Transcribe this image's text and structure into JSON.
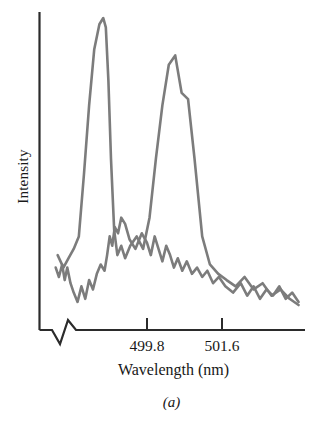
{
  "figure": {
    "subcaption": "(a)",
    "axis_color": "#2b2b2b",
    "trace_color": "#7c7c7c",
    "background": "#ffffff"
  },
  "chart_data": {
    "type": "line",
    "title": "",
    "subtitle": "",
    "xlabel": "Wavelength (nm)",
    "ylabel": "Intensity",
    "grid": false,
    "legend": "none",
    "axis_break": true,
    "xtick_labels": [
      "499.8",
      "501.6"
    ],
    "xtick_values": [
      499.8,
      501.6
    ],
    "ytick_labels": [],
    "xlim": [
      498.9,
      502.9
    ],
    "ylim": [
      0,
      1
    ],
    "annotations": [
      "(a)"
    ],
    "series": [
      {
        "name": "trace-1",
        "color": "#7c7c7c",
        "x": [
          499.02,
          499.07,
          499.12,
          499.16,
          499.2,
          499.25,
          499.3,
          499.36,
          499.42,
          499.48,
          499.54,
          499.6,
          499.66,
          499.72,
          499.78,
          499.82,
          499.86,
          499.9,
          499.94,
          499.99,
          500.04,
          500.1,
          500.17,
          500.26,
          500.36,
          500.44,
          500.5,
          500.56,
          500.62,
          500.68,
          500.74,
          500.8,
          500.86,
          500.92,
          500.99,
          501.06,
          501.14,
          501.22,
          501.3,
          501.38,
          501.47,
          501.56,
          501.66,
          501.78,
          501.9,
          502.0,
          502.1,
          502.2,
          502.3,
          502.4,
          502.5,
          502.6,
          502.7,
          502.8
        ],
        "y": [
          0.2,
          0.17,
          0.21,
          0.16,
          0.2,
          0.15,
          0.12,
          0.09,
          0.14,
          0.1,
          0.16,
          0.13,
          0.18,
          0.21,
          0.19,
          0.24,
          0.3,
          0.27,
          0.33,
          0.31,
          0.36,
          0.34,
          0.29,
          0.26,
          0.31,
          0.28,
          0.24,
          0.3,
          0.26,
          0.22,
          0.27,
          0.24,
          0.2,
          0.23,
          0.19,
          0.22,
          0.18,
          0.2,
          0.17,
          0.19,
          0.15,
          0.17,
          0.14,
          0.12,
          0.15,
          0.11,
          0.14,
          0.1,
          0.13,
          0.11,
          0.14,
          0.1,
          0.12,
          0.09
        ]
      },
      {
        "name": "trace-2",
        "color": "#7c7c7c",
        "x": [
          499.05,
          499.14,
          499.22,
          499.3,
          499.38,
          499.46,
          499.54,
          499.62,
          499.7,
          499.76,
          499.8,
          499.84,
          499.88,
          499.93,
          499.98,
          500.04,
          500.1,
          500.18,
          500.28,
          500.38,
          500.48,
          500.58,
          500.68,
          500.78,
          500.88,
          500.98,
          501.08,
          501.18,
          501.3,
          501.42,
          501.55,
          501.68,
          501.82,
          501.96,
          502.1,
          502.24,
          502.38,
          502.52,
          502.66,
          502.8
        ],
        "y": [
          0.24,
          0.2,
          0.23,
          0.26,
          0.3,
          0.5,
          0.72,
          0.9,
          0.98,
          1.0,
          0.97,
          0.8,
          0.55,
          0.32,
          0.24,
          0.27,
          0.23,
          0.27,
          0.3,
          0.26,
          0.36,
          0.55,
          0.72,
          0.85,
          0.88,
          0.76,
          0.74,
          0.55,
          0.3,
          0.21,
          0.18,
          0.16,
          0.14,
          0.17,
          0.13,
          0.15,
          0.11,
          0.13,
          0.1,
          0.08
        ]
      }
    ]
  }
}
